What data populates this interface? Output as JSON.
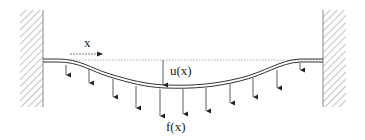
{
  "diagram": {
    "title": "",
    "labels": {
      "x_axis": "x",
      "displacement": "u(x)",
      "load": "f(x)"
    },
    "elements": {
      "left_support": "fixed wall (hatched)",
      "right_support": "fixed wall (hatched)",
      "beam": "deflected elastic beam/string clamped at both ends",
      "reference_line": "dotted horizontal line (undeformed position)",
      "load_arrows_count": 11
    },
    "colors": {
      "stroke": "#333333",
      "hatch": "#9a9a9a",
      "background": "#ffffff"
    }
  }
}
